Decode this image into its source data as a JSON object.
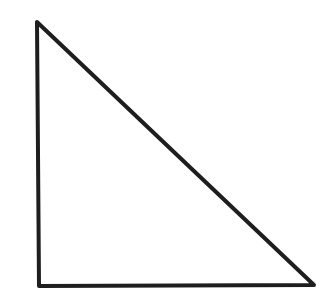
{
  "diagram": {
    "shape": "right-triangle",
    "vertices": [
      {
        "x": 37,
        "y": 22
      },
      {
        "x": 39,
        "y": 286
      },
      {
        "x": 314,
        "y": 285
      }
    ],
    "stroke_color": "#1e1e1e",
    "stroke_width": 4,
    "fill_color": "#ffffff"
  }
}
